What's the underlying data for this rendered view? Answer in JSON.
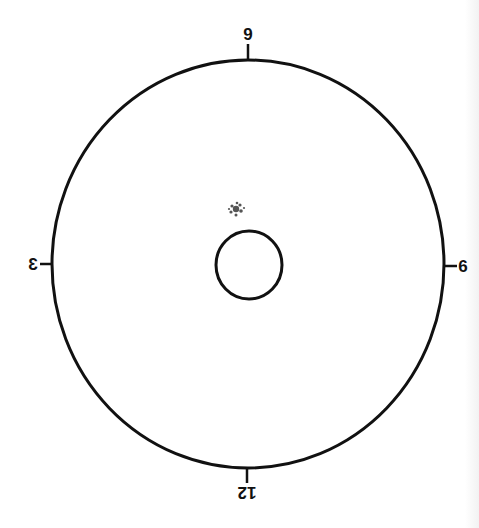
{
  "diagram": {
    "type": "clock-face-dial",
    "orientation": "flipped/mirrored",
    "colors": {
      "stroke": "#111111",
      "background": "#ffffff",
      "speckle": "#555555"
    },
    "outer_circle": {
      "cx": 248,
      "cy": 264,
      "rx": 196,
      "ry": 204
    },
    "inner_circle": {
      "cx": 249,
      "cy": 265,
      "rx": 33,
      "ry": 34
    },
    "speckle_mark": {
      "cx": 236,
      "cy": 209
    },
    "labels": {
      "top": "9",
      "bottom": "12",
      "left": "3",
      "right": "6"
    }
  }
}
